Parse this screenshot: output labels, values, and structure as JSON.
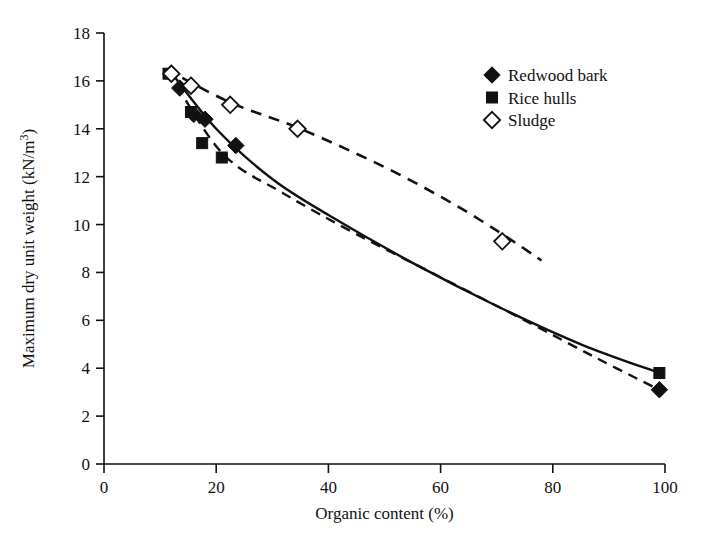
{
  "chart_data": {
    "type": "scatter",
    "title": "",
    "xlabel": "Organic content (%)",
    "ylabel": "Maximum dry unit weight (kN/m3)",
    "ylabel_display": "Maximum dry unit weight (kN/m³)",
    "xlim": [
      0,
      100
    ],
    "ylim": [
      0,
      18
    ],
    "xticks": [
      0,
      20,
      40,
      60,
      80,
      100
    ],
    "yticks": [
      0,
      2,
      4,
      6,
      8,
      10,
      12,
      14,
      16,
      18
    ],
    "xtick_labels": [
      "0",
      "20",
      "40",
      "60",
      "80",
      "100"
    ],
    "ytick_labels": [
      "0",
      "2",
      "4",
      "6",
      "8",
      "10",
      "12",
      "14",
      "16",
      "18"
    ],
    "grid": false,
    "legend_position": "top-right",
    "series": [
      {
        "name": "Redwood bark",
        "marker": "filled-diamond",
        "color": "#111111",
        "line_style": "solid",
        "points": [
          {
            "x": 12.0,
            "y": 16.3
          },
          {
            "x": 13.5,
            "y": 15.7
          },
          {
            "x": 16.0,
            "y": 14.6
          },
          {
            "x": 18.0,
            "y": 14.4
          },
          {
            "x": 23.5,
            "y": 13.3
          },
          {
            "x": 99.0,
            "y": 3.1
          }
        ],
        "fit_curve": [
          {
            "x": 11.5,
            "y": 16.5
          },
          {
            "x": 20.0,
            "y": 14.0
          },
          {
            "x": 30.0,
            "y": 11.9
          },
          {
            "x": 40.0,
            "y": 10.4
          },
          {
            "x": 55.0,
            "y": 8.4
          },
          {
            "x": 70.0,
            "y": 6.6
          },
          {
            "x": 85.0,
            "y": 5.0
          },
          {
            "x": 99.0,
            "y": 3.8
          }
        ]
      },
      {
        "name": "Rice hulls",
        "marker": "filled-square",
        "color": "#111111",
        "line_style": "dashed",
        "points": [
          {
            "x": 11.5,
            "y": 16.3
          },
          {
            "x": 15.5,
            "y": 14.7
          },
          {
            "x": 17.5,
            "y": 13.4
          },
          {
            "x": 21.0,
            "y": 12.8
          },
          {
            "x": 99.0,
            "y": 3.8
          }
        ],
        "fit_curve": [
          {
            "x": 11.5,
            "y": 16.4
          },
          {
            "x": 21.0,
            "y": 13.0
          },
          {
            "x": 32.0,
            "y": 11.3
          },
          {
            "x": 45.0,
            "y": 9.6
          },
          {
            "x": 60.0,
            "y": 7.8
          },
          {
            "x": 75.0,
            "y": 6.0
          },
          {
            "x": 88.0,
            "y": 4.4
          },
          {
            "x": 99.0,
            "y": 3.1
          }
        ]
      },
      {
        "name": "Sludge",
        "marker": "open-diamond",
        "color": "#111111",
        "line_style": "dashed",
        "points": [
          {
            "x": 12.0,
            "y": 16.3
          },
          {
            "x": 15.5,
            "y": 15.8
          },
          {
            "x": 22.5,
            "y": 15.0
          },
          {
            "x": 34.5,
            "y": 14.0
          },
          {
            "x": 71.0,
            "y": 9.3
          }
        ],
        "fit_curve": [
          {
            "x": 11.0,
            "y": 16.5
          },
          {
            "x": 22.5,
            "y": 15.1
          },
          {
            "x": 35.0,
            "y": 14.0
          },
          {
            "x": 50.0,
            "y": 12.4
          },
          {
            "x": 62.0,
            "y": 10.9
          },
          {
            "x": 71.0,
            "y": 9.6
          },
          {
            "x": 78.0,
            "y": 8.5
          }
        ]
      }
    ]
  },
  "legend": {
    "items": [
      {
        "label": "Redwood bark",
        "marker": "filled-diamond"
      },
      {
        "label": "Rice hulls",
        "marker": "filled-square"
      },
      {
        "label": "Sludge",
        "marker": "open-diamond"
      }
    ]
  }
}
